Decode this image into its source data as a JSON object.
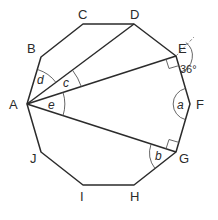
{
  "figure": {
    "type": "regular decagon with diagonals from A",
    "vertices": {
      "A": {
        "label": "A",
        "x": 27,
        "y": 104,
        "lx": 9,
        "ly": 109
      },
      "B": {
        "label": "B",
        "x": 41,
        "y": 57,
        "lx": 27,
        "ly": 53
      },
      "C": {
        "label": "C",
        "x": 83,
        "y": 24,
        "lx": 78,
        "ly": 19
      },
      "D": {
        "label": "D",
        "x": 134,
        "y": 24,
        "lx": 130,
        "ly": 19
      },
      "E": {
        "label": "E",
        "x": 176,
        "y": 56,
        "lx": 178,
        "ly": 53
      },
      "F": {
        "label": "F",
        "x": 190,
        "y": 104,
        "lx": 196,
        "ly": 109
      },
      "G": {
        "label": "G",
        "x": 176,
        "y": 152,
        "lx": 179,
        "ly": 163
      },
      "H": {
        "label": "H",
        "x": 134,
        "y": 185,
        "lx": 130,
        "ly": 201
      },
      "I": {
        "label": "I",
        "x": 83,
        "y": 185,
        "lx": 80,
        "ly": 201
      },
      "J": {
        "label": "J",
        "x": 41,
        "y": 152,
        "lx": 30,
        "ly": 163
      }
    },
    "diagonals": [
      "AD",
      "AE",
      "AG"
    ],
    "angle_labels": {
      "a": "a",
      "b": "b",
      "c": "c",
      "d": "d",
      "e": "e",
      "exterior": "36°"
    },
    "right_angles": [
      "AEF",
      "AGF"
    ],
    "extension_line": "DE extended beyond E (dashed)"
  }
}
